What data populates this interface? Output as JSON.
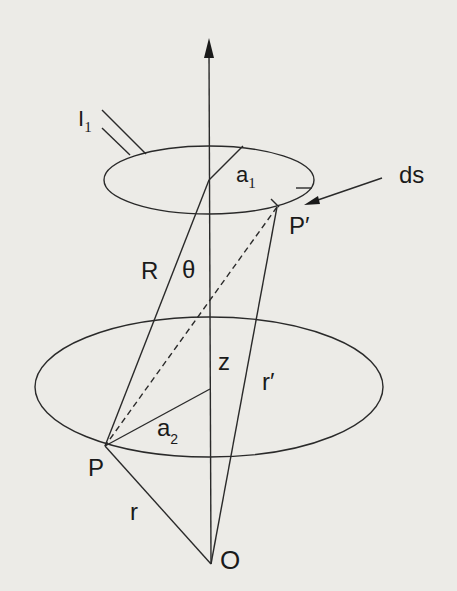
{
  "diagram": {
    "title": "",
    "colors": {
      "background": "#ecebe7",
      "ink": "#1a1a1a"
    },
    "labels": {
      "current": {
        "main": "I",
        "sub": "1"
      },
      "radius_top": {
        "main": "a",
        "sub": "1"
      },
      "element": "ds",
      "point_top": "P′",
      "R": "R",
      "theta": "θ",
      "z": "z",
      "r_prime": "r′",
      "radius_bottom": {
        "main": "a",
        "sub": "2"
      },
      "point_bottom": "P",
      "r": "r",
      "origin": "O"
    },
    "elements": [
      "vertical z-axis with arrow",
      "upper current loop (ellipse) radius a1 carrying I1",
      "lower loop (ellipse) radius a2",
      "source point P′ with line element ds",
      "field point P",
      "line R from upper loop center to P at angle θ",
      "dashed line P′ to P",
      "r′ from O to P′",
      "r from O to P"
    ]
  }
}
